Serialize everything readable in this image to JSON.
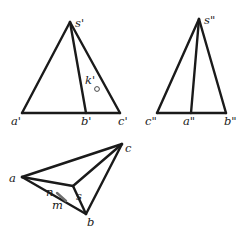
{
  "figure": {
    "width": 250,
    "height": 230,
    "views": {
      "front": {
        "name": "front-view",
        "vertices": {
          "s": [
            70,
            22
          ],
          "a": [
            22,
            113
          ],
          "b": [
            86,
            113
          ],
          "c": [
            120,
            113
          ]
        },
        "edges": [
          [
            "s",
            "a"
          ],
          [
            "s",
            "b"
          ],
          [
            "s",
            "c"
          ],
          [
            "a",
            "c"
          ]
        ],
        "labels": {
          "s": {
            "text": "s'",
            "x": 75,
            "y": 27
          },
          "a": {
            "text": "a'",
            "x": 11,
            "y": 125
          },
          "b": {
            "text": "b'",
            "x": 81,
            "y": 125
          },
          "c": {
            "text": "c'",
            "x": 118,
            "y": 125
          },
          "k": {
            "text": "k'",
            "x": 85,
            "y": 84
          }
        },
        "point_k": {
          "cx": 97,
          "cy": 89,
          "r": 2.4
        }
      },
      "side": {
        "name": "side-view",
        "vertices": {
          "s": [
            199,
            19
          ],
          "c": [
            157,
            113
          ],
          "a": [
            191,
            113
          ],
          "b": [
            226,
            113
          ]
        },
        "edges": [
          [
            "s",
            "c"
          ],
          [
            "s",
            "a"
          ],
          [
            "s",
            "b"
          ],
          [
            "c",
            "b"
          ]
        ],
        "labels": {
          "s": {
            "text": "s\"",
            "x": 204,
            "y": 24
          },
          "c": {
            "text": "c\"",
            "x": 145,
            "y": 125
          },
          "a": {
            "text": "a\"",
            "x": 183,
            "y": 125
          },
          "b": {
            "text": "b\"",
            "x": 224,
            "y": 125
          }
        }
      },
      "top": {
        "name": "top-view",
        "vertices": {
          "a": [
            22,
            177
          ],
          "c": [
            122,
            144
          ],
          "s": [
            73,
            186
          ],
          "b": [
            86,
            214
          ]
        },
        "edges": [
          [
            "a",
            "c"
          ],
          [
            "a",
            "s"
          ],
          [
            "a",
            "b"
          ],
          [
            "c",
            "s"
          ],
          [
            "c",
            "b"
          ],
          [
            "s",
            "b"
          ]
        ],
        "labels": {
          "a": {
            "text": "a",
            "x": 9,
            "y": 182
          },
          "c": {
            "text": "c",
            "x": 125,
            "y": 152
          },
          "s": {
            "text": "s",
            "x": 76,
            "y": 200
          },
          "b": {
            "text": "b",
            "x": 87,
            "y": 226
          },
          "n": {
            "text": "n",
            "x": 46,
            "y": 196
          },
          "m": {
            "text": "m",
            "x": 52,
            "y": 209
          }
        },
        "segment_mn": {
          "x1": 57,
          "y1": 193,
          "x2": 66,
          "y2": 201,
          "color": "#6e6e6e"
        }
      }
    }
  }
}
